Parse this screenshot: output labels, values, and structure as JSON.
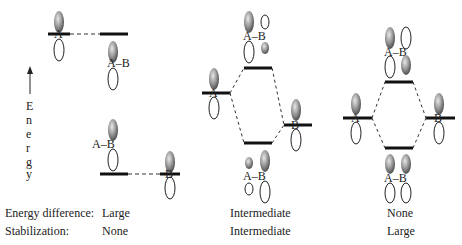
{
  "axis": {
    "label": "Energy",
    "letters": [
      "E",
      "n",
      "e",
      "r",
      "g",
      "y"
    ]
  },
  "atoms": {
    "a": "A",
    "b": "B",
    "bond": "A–B"
  },
  "rows": [
    {
      "label": "Energy difference:",
      "values": [
        "Large",
        "Intermediate",
        "None"
      ]
    },
    {
      "label": "Stabilization:",
      "values": [
        "None",
        "Intermediate",
        "Large"
      ]
    }
  ],
  "colors": {
    "line": "#111111",
    "lobe_fill": "#8a8a8a",
    "text": "#222222"
  }
}
